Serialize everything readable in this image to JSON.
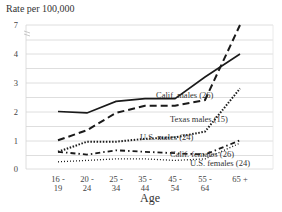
{
  "chart_data": {
    "type": "line",
    "title": "",
    "ylabel": "Rate per 100,000",
    "xlabel": "Age",
    "categories": [
      "16 - 19",
      "20 - 24",
      "25 - 34",
      "35 - 44",
      "45 - 54",
      "55 - 64",
      "65 +"
    ],
    "category_lines": [
      [
        "16 -",
        "19"
      ],
      [
        "20 -",
        "24"
      ],
      [
        "25 -",
        "34"
      ],
      [
        "35 -",
        "44"
      ],
      [
        "45 -",
        "54"
      ],
      [
        "55 -",
        "64"
      ],
      [
        "65 +",
        ""
      ]
    ],
    "y_tick_labels": [
      "0",
      "1",
      "2",
      "3",
      "4",
      "7"
    ],
    "y_axis_break": true,
    "grid": true,
    "legend": "inline annotations",
    "series": [
      {
        "name": "Calif. males (26)",
        "style": "solid",
        "values": [
          2.0,
          1.95,
          2.35,
          2.45,
          2.45,
          3.2,
          4.0
        ]
      },
      {
        "name": "Texas males (15)",
        "style": "dashed",
        "values": [
          1.0,
          1.35,
          1.95,
          2.2,
          2.2,
          2.4,
          7.0
        ]
      },
      {
        "name": "U.S. males (24)",
        "style": "dotted-heavy",
        "values": [
          0.6,
          0.95,
          0.95,
          1.05,
          1.1,
          1.3,
          2.8
        ]
      },
      {
        "name": "Calif. females (26)",
        "style": "dash-dot",
        "values": [
          0.6,
          0.5,
          0.65,
          0.6,
          0.55,
          0.5,
          1.0
        ]
      },
      {
        "name": "U.S. females (24)",
        "style": "dotted-light",
        "values": [
          0.25,
          0.3,
          0.35,
          0.35,
          0.3,
          0.35,
          0.9
        ]
      }
    ]
  },
  "labels": {
    "ylabel": "Rate per 100,000",
    "xlabel": "Age"
  }
}
